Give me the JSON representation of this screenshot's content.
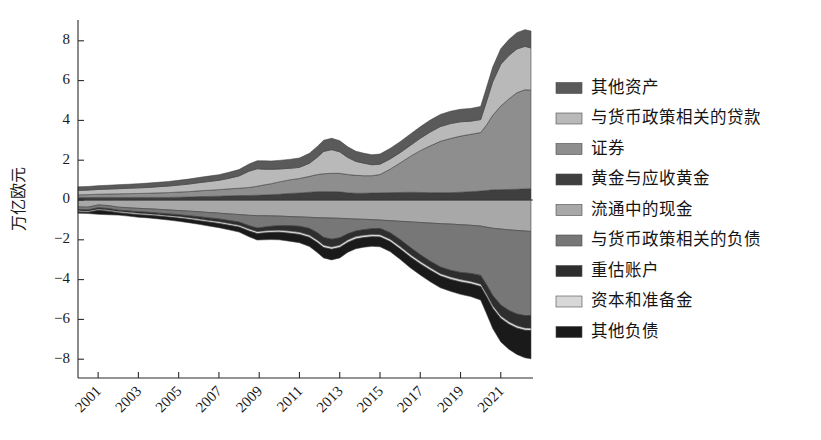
{
  "chart_data": {
    "type": "area",
    "title": "",
    "subtitle": "",
    "xlabel": "",
    "ylabel": "万亿欧元",
    "stacked": true,
    "diverging": true,
    "grid": false,
    "legend_position": "right",
    "xlim": [
      2000.0,
      2022.6
    ],
    "ylim": [
      -9.0,
      9.0
    ],
    "yticks": [
      -8,
      -6,
      -4,
      -2,
      0,
      2,
      4,
      6,
      8
    ],
    "ytick_labels": [
      "−8",
      "−6",
      "−4",
      "−2",
      "0",
      "2",
      "4",
      "6",
      "8"
    ],
    "xticks": [
      2001,
      2003,
      2005,
      2007,
      2009,
      2011,
      2013,
      2015,
      2017,
      2019,
      2021
    ],
    "xtick_labels": [
      "2001",
      "2003",
      "2005",
      "2007",
      "2009",
      "2011",
      "2013",
      "2015",
      "2017",
      "2019",
      "2021"
    ],
    "xtick_rotation": 45,
    "x": [
      2000.0,
      2000.5,
      2001.0,
      2001.5,
      2002.0,
      2002.5,
      2003.0,
      2003.5,
      2004.0,
      2004.5,
      2005.0,
      2005.5,
      2006.0,
      2006.5,
      2007.0,
      2007.5,
      2008.0,
      2008.5,
      2008.9,
      2009.2,
      2009.6,
      2010.0,
      2010.5,
      2011.0,
      2011.5,
      2011.9,
      2012.2,
      2012.6,
      2013.0,
      2013.4,
      2013.8,
      2014.2,
      2014.6,
      2015.0,
      2015.5,
      2016.0,
      2016.5,
      2017.0,
      2017.5,
      2018.0,
      2018.5,
      2019.0,
      2019.5,
      2020.0,
      2020.3,
      2020.6,
      2021.0,
      2021.4,
      2021.8,
      2022.2,
      2022.5
    ],
    "series": [
      {
        "name": "黄金与应收黄金",
        "key": "gold",
        "side": "assets",
        "order": 1,
        "color": "#3f3f3f",
        "values": [
          0.12,
          0.12,
          0.13,
          0.13,
          0.13,
          0.13,
          0.13,
          0.13,
          0.13,
          0.13,
          0.14,
          0.15,
          0.17,
          0.18,
          0.19,
          0.21,
          0.22,
          0.23,
          0.24,
          0.25,
          0.27,
          0.29,
          0.33,
          0.35,
          0.39,
          0.42,
          0.42,
          0.42,
          0.41,
          0.36,
          0.34,
          0.34,
          0.35,
          0.36,
          0.37,
          0.38,
          0.39,
          0.38,
          0.37,
          0.37,
          0.37,
          0.39,
          0.42,
          0.45,
          0.48,
          0.51,
          0.52,
          0.53,
          0.54,
          0.56,
          0.57
        ]
      },
      {
        "name": "证券",
        "key": "securities",
        "side": "assets",
        "order": 2,
        "color": "#8e8e8e",
        "values": [
          0.14,
          0.15,
          0.16,
          0.17,
          0.18,
          0.19,
          0.2,
          0.21,
          0.23,
          0.24,
          0.26,
          0.27,
          0.29,
          0.31,
          0.33,
          0.35,
          0.37,
          0.4,
          0.45,
          0.5,
          0.55,
          0.62,
          0.68,
          0.73,
          0.8,
          0.86,
          0.9,
          0.92,
          0.93,
          0.92,
          0.9,
          0.88,
          0.87,
          0.92,
          1.18,
          1.48,
          1.8,
          2.1,
          2.35,
          2.58,
          2.72,
          2.82,
          2.88,
          2.94,
          3.3,
          3.75,
          4.2,
          4.55,
          4.85,
          4.98,
          4.95
        ]
      },
      {
        "name": "与货币政策相关的贷款",
        "key": "lending",
        "side": "assets",
        "order": 3,
        "color": "#b9b9b9",
        "values": [
          0.22,
          0.23,
          0.24,
          0.25,
          0.26,
          0.27,
          0.28,
          0.29,
          0.31,
          0.33,
          0.35,
          0.38,
          0.41,
          0.44,
          0.47,
          0.53,
          0.62,
          0.82,
          0.88,
          0.8,
          0.72,
          0.65,
          0.58,
          0.56,
          0.66,
          0.88,
          1.12,
          1.19,
          1.08,
          0.86,
          0.7,
          0.63,
          0.55,
          0.52,
          0.51,
          0.52,
          0.55,
          0.62,
          0.7,
          0.74,
          0.75,
          0.72,
          0.66,
          0.65,
          1.2,
          1.68,
          2.1,
          2.18,
          2.2,
          2.18,
          2.12
        ]
      },
      {
        "name": "其他资产",
        "key": "other_assets",
        "side": "assets",
        "order": 4,
        "color": "#5a5a5a",
        "values": [
          0.18,
          0.18,
          0.19,
          0.19,
          0.2,
          0.2,
          0.21,
          0.22,
          0.22,
          0.23,
          0.24,
          0.25,
          0.26,
          0.27,
          0.28,
          0.3,
          0.32,
          0.36,
          0.4,
          0.42,
          0.42,
          0.43,
          0.45,
          0.47,
          0.5,
          0.54,
          0.56,
          0.57,
          0.56,
          0.53,
          0.51,
          0.5,
          0.5,
          0.51,
          0.53,
          0.55,
          0.57,
          0.58,
          0.6,
          0.61,
          0.62,
          0.63,
          0.64,
          0.66,
          0.7,
          0.74,
          0.78,
          0.8,
          0.82,
          0.84,
          0.85
        ]
      },
      {
        "name": "流通中的现金",
        "key": "banknotes",
        "side": "liabilities",
        "order": 1,
        "color": "#a8a8a8",
        "values": [
          0.35,
          0.36,
          0.25,
          0.28,
          0.36,
          0.39,
          0.42,
          0.44,
          0.47,
          0.5,
          0.53,
          0.56,
          0.59,
          0.63,
          0.66,
          0.7,
          0.73,
          0.77,
          0.79,
          0.79,
          0.8,
          0.81,
          0.83,
          0.85,
          0.87,
          0.89,
          0.9,
          0.91,
          0.92,
          0.94,
          0.96,
          0.97,
          0.99,
          1.01,
          1.04,
          1.07,
          1.1,
          1.13,
          1.16,
          1.19,
          1.21,
          1.24,
          1.27,
          1.31,
          1.37,
          1.42,
          1.46,
          1.5,
          1.53,
          1.56,
          1.58
        ]
      },
      {
        "name": "与货币政策相关的负债",
        "key": "mp_liabilities",
        "side": "liabilities",
        "order": 2,
        "color": "#777777",
        "values": [
          0.13,
          0.14,
          0.14,
          0.15,
          0.15,
          0.16,
          0.17,
          0.18,
          0.19,
          0.2,
          0.21,
          0.23,
          0.25,
          0.27,
          0.29,
          0.33,
          0.38,
          0.52,
          0.62,
          0.58,
          0.52,
          0.48,
          0.46,
          0.47,
          0.56,
          0.76,
          0.98,
          1.06,
          0.98,
          0.76,
          0.6,
          0.52,
          0.45,
          0.42,
          0.6,
          0.92,
          1.28,
          1.62,
          1.92,
          2.18,
          2.32,
          2.4,
          2.42,
          2.48,
          2.9,
          3.38,
          3.82,
          4.05,
          4.2,
          4.25,
          4.22
        ]
      },
      {
        "name": "重估账户",
        "key": "revaluation",
        "side": "liabilities",
        "order": 3,
        "color": "#2e2e2e",
        "values": [
          0.06,
          0.06,
          0.07,
          0.07,
          0.07,
          0.07,
          0.08,
          0.08,
          0.08,
          0.09,
          0.09,
          0.1,
          0.12,
          0.13,
          0.14,
          0.15,
          0.16,
          0.17,
          0.18,
          0.19,
          0.21,
          0.23,
          0.27,
          0.3,
          0.34,
          0.38,
          0.39,
          0.39,
          0.37,
          0.31,
          0.28,
          0.28,
          0.29,
          0.31,
          0.33,
          0.35,
          0.36,
          0.34,
          0.33,
          0.33,
          0.34,
          0.36,
          0.4,
          0.44,
          0.48,
          0.52,
          0.55,
          0.57,
          0.59,
          0.62,
          0.64
        ]
      },
      {
        "name": "资本和准备金",
        "key": "capital",
        "side": "liabilities",
        "order": 4,
        "color": "#d8d8d8",
        "values": [
          0.06,
          0.06,
          0.06,
          0.06,
          0.06,
          0.07,
          0.07,
          0.07,
          0.07,
          0.07,
          0.08,
          0.08,
          0.08,
          0.08,
          0.09,
          0.09,
          0.09,
          0.1,
          0.1,
          0.1,
          0.1,
          0.1,
          0.11,
          0.11,
          0.11,
          0.12,
          0.12,
          0.12,
          0.12,
          0.12,
          0.12,
          0.12,
          0.12,
          0.12,
          0.12,
          0.12,
          0.12,
          0.12,
          0.12,
          0.12,
          0.12,
          0.12,
          0.12,
          0.12,
          0.12,
          0.12,
          0.12,
          0.12,
          0.12,
          0.12,
          0.12
        ]
      },
      {
        "name": "其他负债",
        "key": "other_liabilities",
        "side": "liabilities",
        "order": 5,
        "color": "#1a1a1a",
        "values": [
          0.06,
          0.06,
          0.2,
          0.18,
          0.12,
          0.12,
          0.13,
          0.13,
          0.14,
          0.15,
          0.16,
          0.17,
          0.18,
          0.2,
          0.21,
          0.23,
          0.25,
          0.29,
          0.32,
          0.34,
          0.36,
          0.38,
          0.4,
          0.42,
          0.46,
          0.5,
          0.52,
          0.53,
          0.52,
          0.5,
          0.49,
          0.48,
          0.48,
          0.49,
          0.5,
          0.52,
          0.54,
          0.56,
          0.58,
          0.59,
          0.6,
          0.62,
          0.64,
          0.68,
          0.86,
          1.02,
          1.18,
          1.26,
          1.32,
          1.38,
          1.42
        ]
      }
    ],
    "legend_entries": [
      {
        "label": "其他资产",
        "color": "#5a5a5a"
      },
      {
        "label": "与货币政策相关的贷款",
        "color": "#b9b9b9"
      },
      {
        "label": "证券",
        "color": "#8e8e8e"
      },
      {
        "label": "黄金与应收黄金",
        "color": "#3f3f3f"
      },
      {
        "label": "流通中的现金",
        "color": "#a8a8a8"
      },
      {
        "label": "与货币政策相关的负债",
        "color": "#777777"
      },
      {
        "label": "重估账户",
        "color": "#2e2e2e"
      },
      {
        "label": "资本和准备金",
        "color": "#d8d8d8"
      },
      {
        "label": "其他负债",
        "color": "#1a1a1a"
      }
    ]
  },
  "figure": {
    "background": "#ffffff",
    "axis_color": "#2b2b2b"
  }
}
